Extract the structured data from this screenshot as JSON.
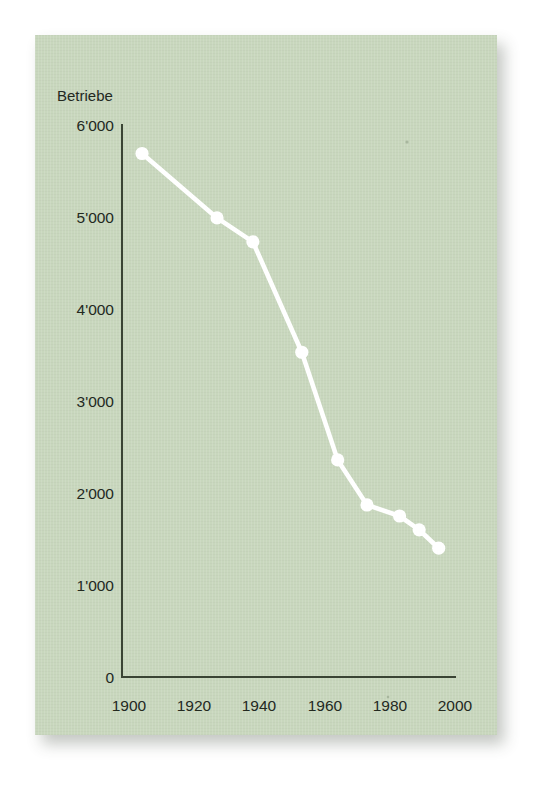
{
  "card": {
    "background_color": "#c8d7bd",
    "axis_color": "#3a4434",
    "series_color": "#ffffff"
  },
  "chart_data": {
    "type": "line",
    "title": "",
    "subtitle": "",
    "xlabel": "",
    "ylabel": "Betriebe",
    "xlim": [
      1900,
      2003
    ],
    "ylim": [
      0,
      6000
    ],
    "grid": false,
    "legend": null,
    "x_tick_labels": [
      "1900",
      "1920",
      "1940",
      "1960",
      "1980",
      "2000"
    ],
    "x_ticks": [
      1900,
      1920,
      1940,
      1960,
      1980,
      2000
    ],
    "y_tick_labels": [
      "0",
      "1'000",
      "2'000",
      "3'000",
      "4'000",
      "5'000",
      "6'000"
    ],
    "y_ticks": [
      0,
      1000,
      2000,
      3000,
      4000,
      5000,
      6000
    ],
    "series": [
      {
        "name": "Betriebe",
        "color": "#ffffff",
        "marker": "circle",
        "x": [
          1904,
          1927,
          1938,
          1953,
          1964,
          1973,
          1983,
          1989,
          1995
        ],
        "values": [
          5690,
          4990,
          4730,
          3530,
          2360,
          1870,
          1750,
          1600,
          1400
        ]
      }
    ]
  }
}
